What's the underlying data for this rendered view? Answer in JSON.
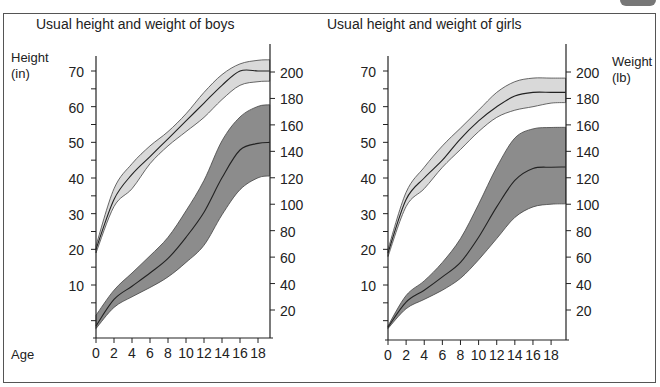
{
  "colors": {
    "height_band": "#d9d9d9",
    "weight_band": "#8c8c8c",
    "line": "#222222",
    "frame": "#555555"
  },
  "labels": {
    "height_axis": "Height",
    "height_unit": "(in)",
    "weight_axis": "Weight",
    "weight_unit": "(lb)",
    "age_axis": "Age"
  },
  "chart_data": [
    {
      "type": "area",
      "title": "Usual height and weight of boys",
      "xlabel": "Age",
      "ylabel": "Height (in)",
      "y2label": "Weight (lb)",
      "x_ticks": [
        0,
        2,
        4,
        6,
        8,
        10,
        12,
        14,
        16,
        18
      ],
      "y_ticks": [
        10,
        20,
        30,
        40,
        50,
        60,
        70
      ],
      "y2_ticks": [
        20,
        40,
        60,
        80,
        100,
        120,
        140,
        160,
        180,
        200
      ],
      "x": [
        0,
        2,
        4,
        6,
        8,
        10,
        12,
        14,
        16,
        18
      ],
      "series": [
        {
          "name": "Height (median)",
          "axis": "left",
          "values": [
            20,
            34,
            41,
            46,
            51,
            56,
            61,
            66,
            70,
            70
          ]
        },
        {
          "name": "Height (upper)",
          "axis": "left",
          "values": [
            21,
            37,
            44,
            49,
            53,
            58,
            64,
            69,
            72,
            73
          ]
        },
        {
          "name": "Height (lower)",
          "axis": "left",
          "values": [
            19,
            32,
            37,
            44,
            49,
            53,
            57,
            62,
            66,
            67
          ]
        },
        {
          "name": "Weight (median)",
          "axis": "right",
          "values": [
            8,
            28,
            38,
            48,
            59,
            75,
            94,
            120,
            141,
            146
          ]
        },
        {
          "name": "Weight (upper)",
          "axis": "right",
          "values": [
            16,
            35,
            48,
            61,
            75,
            95,
            118,
            148,
            166,
            174
          ]
        },
        {
          "name": "Weight (lower)",
          "axis": "right",
          "values": [
            6,
            22,
            30,
            37,
            45,
            56,
            69,
            92,
            111,
            120
          ]
        }
      ]
    },
    {
      "type": "area",
      "title": "Usual height and weight of girls",
      "xlabel": "Age",
      "ylabel": "Height (in)",
      "y2label": "Weight (lb)",
      "x_ticks": [
        0,
        2,
        4,
        6,
        8,
        10,
        12,
        14,
        16,
        18
      ],
      "y_ticks": [
        10,
        20,
        30,
        40,
        50,
        60,
        70
      ],
      "y2_ticks": [
        20,
        40,
        60,
        80,
        100,
        120,
        140,
        160,
        180,
        200
      ],
      "x": [
        0,
        2,
        4,
        6,
        8,
        10,
        12,
        14,
        16,
        18
      ],
      "series": [
        {
          "name": "Height (median)",
          "axis": "left",
          "values": [
            19,
            34,
            40,
            45,
            51,
            56,
            60,
            63,
            64,
            64
          ]
        },
        {
          "name": "Height (upper)",
          "axis": "left",
          "values": [
            20,
            36,
            43,
            49,
            54,
            59,
            64,
            67,
            68,
            68
          ]
        },
        {
          "name": "Height (lower)",
          "axis": "left",
          "values": [
            18,
            32,
            37,
            43,
            48,
            53,
            57,
            59,
            60,
            61
          ]
        },
        {
          "name": "Weight (median)",
          "axis": "right",
          "values": [
            7,
            26,
            35,
            45,
            56,
            75,
            98,
            118,
            127,
            128
          ]
        },
        {
          "name": "Weight (upper)",
          "axis": "right",
          "values": [
            8,
            31,
            42,
            56,
            74,
            100,
            128,
            150,
            157,
            158
          ]
        },
        {
          "name": "Weight (lower)",
          "axis": "right",
          "values": [
            6,
            21,
            28,
            35,
            44,
            58,
            74,
            90,
            98,
            100
          ]
        }
      ]
    }
  ]
}
